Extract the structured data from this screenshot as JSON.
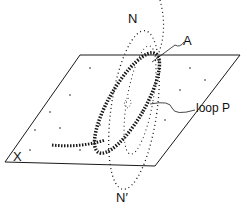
{
  "labels": {
    "n": "N",
    "a": "A",
    "loop_p": "loop P",
    "x": "X",
    "n_prime": "N′"
  },
  "colors": {
    "ink": "#1a1a1a",
    "background": "#ffffff"
  }
}
